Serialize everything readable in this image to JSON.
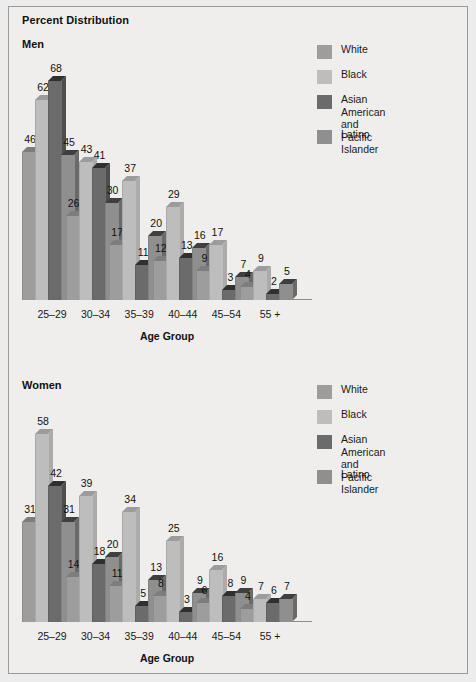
{
  "figure": {
    "title": "Percent Distribution",
    "background_color": "#efeeec",
    "border_color": "#9a9a9a"
  },
  "legend": {
    "items": [
      {
        "label": "White",
        "color": "#9d9d9d",
        "top_color": "#7d7d7d",
        "side_color": "#8a8a8a"
      },
      {
        "label": "Black",
        "color": "#bdbdbd",
        "top_color": "#9c9c9c",
        "side_color": "#ababab"
      },
      {
        "label": "Asian American\nand Pacific Islander",
        "color": "#6b6b6b",
        "top_color": "#303030",
        "side_color": "#4e4e4e"
      },
      {
        "label": "Latino",
        "color": "#8f8f8f",
        "top_color": "#3f3f3f",
        "side_color": "#6a6a6a"
      }
    ]
  },
  "chart_data": [
    {
      "type": "bar",
      "title": "Men",
      "xlabel": "Age Group",
      "ylabel": "",
      "ylim": [
        0,
        68
      ],
      "grid": false,
      "legend_position": "top-right",
      "categories": [
        "25–29",
        "30–34",
        "35–39",
        "40–44",
        "45–54",
        "55 +"
      ],
      "series": [
        {
          "name": "White",
          "values": [
            46,
            26,
            17,
            12,
            9,
            4
          ]
        },
        {
          "name": "Black",
          "values": [
            62,
            43,
            37,
            29,
            17,
            9
          ]
        },
        {
          "name": "Asian American and Pacific Islander",
          "values": [
            68,
            41,
            11,
            13,
            3,
            2
          ]
        },
        {
          "name": "Latino",
          "values": [
            45,
            30,
            20,
            16,
            7,
            5
          ]
        }
      ]
    },
    {
      "type": "bar",
      "title": "Women",
      "xlabel": "Age Group",
      "ylabel": "",
      "ylim": [
        0,
        58
      ],
      "grid": false,
      "legend_position": "top-right",
      "categories": [
        "25–29",
        "30–34",
        "35–39",
        "40–44",
        "45–54",
        "55 +"
      ],
      "series": [
        {
          "name": "White",
          "values": [
            31,
            14,
            11,
            8,
            6,
            4
          ]
        },
        {
          "name": "Black",
          "values": [
            58,
            39,
            34,
            25,
            16,
            7
          ]
        },
        {
          "name": "Asian American and Pacific Islander",
          "values": [
            42,
            18,
            5,
            3,
            8,
            6
          ]
        },
        {
          "name": "Latino",
          "values": [
            31,
            20,
            13,
            9,
            9,
            7
          ]
        }
      ]
    }
  ]
}
